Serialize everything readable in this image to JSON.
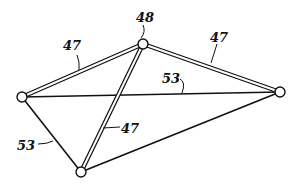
{
  "figure": {
    "colors": {
      "ink": "#111111",
      "background": "#ffffff"
    },
    "nodes": [
      {
        "id": "top",
        "x": 143,
        "y": 44,
        "r": 5
      },
      {
        "id": "left",
        "x": 22,
        "y": 97,
        "r": 5
      },
      {
        "id": "right",
        "x": 280,
        "y": 92,
        "r": 5
      },
      {
        "id": "bottom",
        "x": 81,
        "y": 172,
        "r": 5
      }
    ],
    "struts": [
      {
        "from": "top",
        "to": "left",
        "ref": "47"
      },
      {
        "from": "top",
        "to": "right",
        "ref": "47"
      },
      {
        "from": "top",
        "to": "bottom",
        "ref": "47"
      }
    ],
    "cables": [
      {
        "from": "left",
        "to": "right",
        "ref": "53"
      },
      {
        "from": "left",
        "to": "bottom",
        "ref": "53"
      },
      {
        "from": "bottom",
        "to": "right",
        "ref": "53"
      }
    ],
    "labels": [
      {
        "text": "48",
        "x": 136,
        "y": 22
      },
      {
        "text": "47",
        "x": 63,
        "y": 50
      },
      {
        "text": "47",
        "x": 210,
        "y": 42
      },
      {
        "text": "53",
        "x": 160,
        "y": 83
      },
      {
        "text": "47",
        "x": 122,
        "y": 130
      },
      {
        "text": "53",
        "x": 15,
        "y": 147
      }
    ]
  }
}
